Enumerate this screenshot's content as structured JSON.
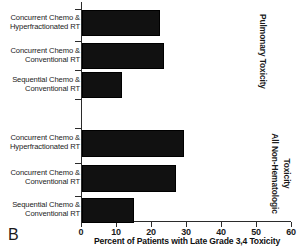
{
  "panel": {
    "label": "B"
  },
  "chart_data": {
    "type": "bar",
    "orientation": "horizontal",
    "title": "",
    "xlabel": "Percent of Patients with Late Grade 3,4 Toxicity",
    "ylabel": "",
    "xlim": [
      0,
      60
    ],
    "xticks": [
      0,
      10,
      20,
      30,
      40,
      50,
      60
    ],
    "xtick_labels": [
      "0",
      "10",
      "20",
      "30",
      "40",
      "50",
      "60"
    ],
    "grid": false,
    "legend": false,
    "bar_color": "#111111",
    "groups": [
      {
        "name": "Pulmonary Toxicity",
        "side_label_lines": [
          "Pulmonary Toxicity"
        ],
        "categories": [
          "Concurrent Chemo &\nHyperfractionated RT",
          "Concurrent Chemo &\nConventional RT",
          "Sequential Chemo &\nConventional RT"
        ],
        "values": [
          21.7,
          22.9,
          10.9
        ]
      },
      {
        "name": "All Non-Hematologic Toxicity",
        "side_label_lines": [
          "All Non-Hematologic",
          "Toxicity"
        ],
        "categories": [
          "Concurrent Chemo &\nHyperfractionated RT",
          "Concurrent Chemo &\nConventional RT",
          "Sequential Chemo &\nConventional RT"
        ],
        "values": [
          28.6,
          26.3,
          14.3
        ]
      }
    ]
  }
}
